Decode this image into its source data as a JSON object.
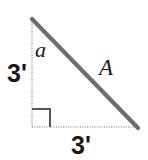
{
  "figure": {
    "background_color": "#ffffff",
    "labels": {
      "angle": "a",
      "hypotenuse": "A",
      "vertical_leg": "3'",
      "horizontal_leg": "3'"
    },
    "colors": {
      "hypotenuse_stroke": "#6e6e6e",
      "leg_stroke": "#b5b5b5",
      "right_angle_stroke": "#555555",
      "label_text": "#1a1a1a"
    },
    "geometry": {
      "apex": [
        32,
        19
      ],
      "right_angle_vertex": [
        32,
        127
      ],
      "bottom_right_vertex": [
        138,
        128
      ],
      "right_angle_marker_size": 18
    }
  }
}
